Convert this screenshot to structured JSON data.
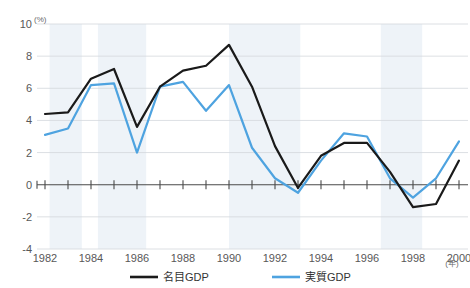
{
  "chart_data": {
    "type": "line",
    "title": "",
    "xlabel": "(年)",
    "ylabel": "(%)",
    "x": [
      1982,
      1983,
      1984,
      1985,
      1986,
      1987,
      1988,
      1989,
      1990,
      1991,
      1992,
      1993,
      1994,
      1995,
      1996,
      1997,
      1998,
      1999,
      2000
    ],
    "xticklabels": [
      "1982",
      "1984",
      "1986",
      "1988",
      "1990",
      "1992",
      "1994",
      "1996",
      "1998",
      "2000"
    ],
    "xtickvalues": [
      1982,
      1984,
      1986,
      1988,
      1990,
      1992,
      1994,
      1996,
      1998,
      2000
    ],
    "yticklabels": [
      "10",
      "8",
      "6",
      "4",
      "2",
      "0",
      "-2",
      "-4"
    ],
    "ytickvalues": [
      10,
      8,
      6,
      4,
      2,
      0,
      -2,
      -4
    ],
    "xlim": [
      1982,
      2000
    ],
    "ylim": [
      -4,
      10
    ],
    "grid": true,
    "legend_position": "bottom",
    "series": [
      {
        "name": "名目GDP",
        "color": "#1a1a1a",
        "values": [
          4.4,
          4.5,
          6.6,
          7.2,
          3.6,
          6.1,
          7.1,
          7.4,
          8.7,
          6.1,
          2.4,
          -0.2,
          1.8,
          2.6,
          2.6,
          0.8,
          -1.4,
          -1.2,
          1.5
        ]
      },
      {
        "name": "実質GDP",
        "color": "#4ea3e0",
        "values": [
          3.1,
          3.5,
          6.2,
          6.3,
          2.0,
          6.1,
          6.4,
          4.6,
          6.2,
          2.3,
          0.4,
          -0.5,
          1.5,
          3.2,
          3.0,
          0.4,
          -0.8,
          0.4,
          2.7
        ]
      }
    ],
    "shaded_bands": [
      {
        "from": 1982.2,
        "to": 1983.6
      },
      {
        "from": 1984.3,
        "to": 1986.4
      },
      {
        "from": 1990.0,
        "to": 1993.1
      },
      {
        "from": 1996.6,
        "to": 1998.4
      }
    ],
    "band_color": "#eef3f8"
  },
  "axes": {
    "y_unit_label": "(%)",
    "x_unit_label": "(年)"
  },
  "legend": {
    "items": [
      {
        "label": "名目GDP",
        "color": "#1a1a1a",
        "key": "nominal-gdp"
      },
      {
        "label": "実質GDP",
        "color": "#4ea3e0",
        "key": "real-gdp"
      }
    ]
  }
}
